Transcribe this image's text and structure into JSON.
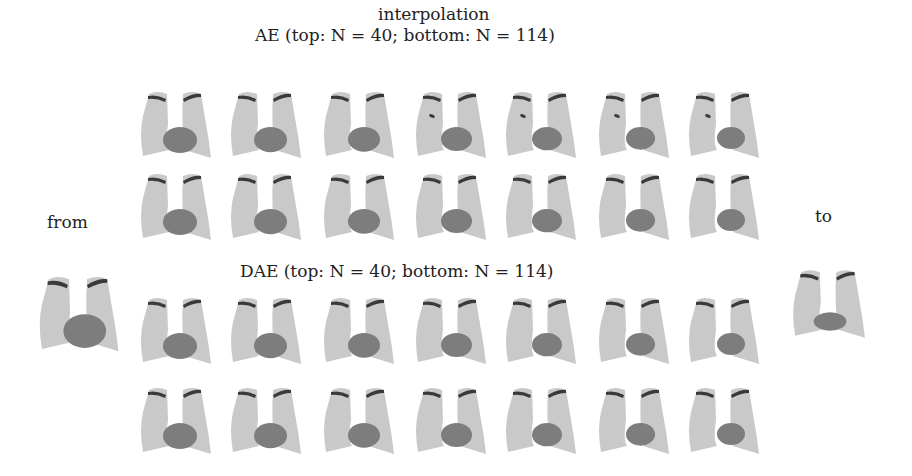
{
  "figure": {
    "title": "interpolation",
    "from_label": "from",
    "to_label": "to",
    "ae_label": "AE (top: N = 40; bottom: N = 114)",
    "dae_label": "DAE (top: N = 40; bottom: N = 114)",
    "colors": {
      "lung": "#c9c9c9",
      "heart": "#7d7d7d",
      "clavicle": "#3a3a3a",
      "background": "#ffffff"
    },
    "groups": [
      {
        "name": "AE",
        "rows": [
          {
            "N": 40,
            "steps": 7
          },
          {
            "N": 114,
            "steps": 7
          }
        ]
      },
      {
        "name": "DAE",
        "rows": [
          {
            "N": 40,
            "steps": 7
          },
          {
            "N": 114,
            "steps": 7
          }
        ]
      }
    ]
  }
}
